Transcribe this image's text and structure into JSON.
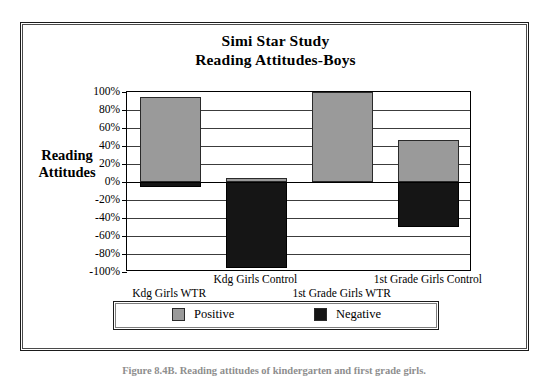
{
  "figure": {
    "caption": "Figure 8.4B. Reading attitudes of kindergarten and first grade girls."
  },
  "chart_data": {
    "type": "bar",
    "title": "Simi Star Study\nReading Attitudes-Boys",
    "title_lines": [
      "Simi Star Study",
      "Reading Attitudes-Boys"
    ],
    "subtitle": "",
    "xlabel": "",
    "ylabel": "Reading Attitudes",
    "ylabel_lines": [
      "Reading",
      "Attitudes"
    ],
    "ylim": [
      -100,
      100
    ],
    "ytick_labels": [
      "100%",
      "80%",
      "60%",
      "40%",
      "20%",
      "0%",
      "-20%",
      "-40%",
      "-60%",
      "-80%",
      "-100%"
    ],
    "ytick_values": [
      100,
      80,
      60,
      40,
      20,
      0,
      -20,
      -40,
      -60,
      -80,
      -100
    ],
    "grid": true,
    "stacked": true,
    "legend_position": "bottom",
    "categories": [
      "Kdg Girls WTR",
      "Kdg Girls Control",
      "1st Grade Girls WTR",
      "1st Grade Girls Control"
    ],
    "series": [
      {
        "name": "Positive",
        "color": "#9a9a9a",
        "values": [
          95,
          5,
          100,
          47
        ]
      },
      {
        "name": "Negative",
        "color": "#151515",
        "values": [
          -5,
          -95,
          0,
          -50
        ]
      }
    ]
  },
  "legend": {
    "items": [
      {
        "label": "Positive",
        "color": "#9a9a9a"
      },
      {
        "label": "Negative",
        "color": "#151515"
      }
    ]
  }
}
